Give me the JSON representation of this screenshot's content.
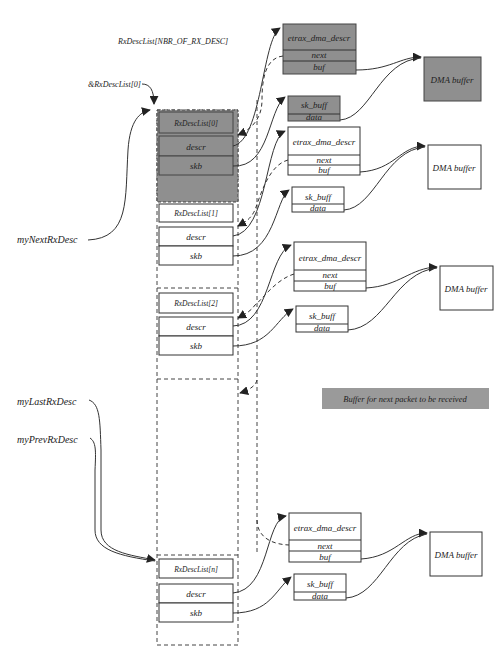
{
  "diagram": {
    "array_label": "RxDescList[NBR_OF_RX_DESC]",
    "first_ptr_label": "&RxDescList[0]",
    "pointers": {
      "next": "myNextRxDesc",
      "last": "myLastRxDesc",
      "prev": "myPrevRxDesc"
    },
    "descriptors": [
      {
        "title": "RxDescList[0]",
        "field1": "descr",
        "field2": "skb",
        "highlight": true
      },
      {
        "title": "RxDescList[1]",
        "field1": "descr",
        "field2": "skb",
        "highlight": false
      },
      {
        "title": "RxDescList[2]",
        "field1": "descr",
        "field2": "skb",
        "highlight": false
      },
      {
        "title": "RxDescList[n]",
        "field1": "descr",
        "field2": "skb",
        "highlight": false
      }
    ],
    "dma_descr": {
      "title": "etrax_dma_descr",
      "next": "next",
      "buf": "buf"
    },
    "sk_buff": {
      "title": "sk_buff",
      "data": "data"
    },
    "dma_buffer": "DMA buffer",
    "legend": "Buffer for next packet to be received",
    "colors": {
      "highlight": "#8f8f8f",
      "stroke": "#333333",
      "background": "#ffffff"
    }
  }
}
